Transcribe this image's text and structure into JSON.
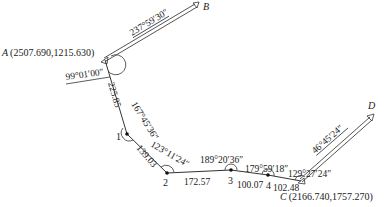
{
  "diagram": {
    "type": "traverse-survey",
    "points": {
      "A": {
        "label": "A",
        "coords": "(2507.690,1215.630)"
      },
      "B": {
        "label": "B"
      },
      "C": {
        "label": "C",
        "coords": "(2166.740,1757.270)"
      },
      "D": {
        "label": "D"
      },
      "p1": {
        "label": "1"
      },
      "p2": {
        "label": "2"
      },
      "p3": {
        "label": "3"
      },
      "p4": {
        "label": "4"
      }
    },
    "azimuths": {
      "AB": "237°59′30″",
      "CD": "46°45′24″"
    },
    "angles": {
      "A": "99°01′00″",
      "p1": "167°45′36″",
      "p2": "123°11′24″",
      "p3": "189°20′36″",
      "p4": "179°59′18″",
      "C": "129°27′24″"
    },
    "distances": {
      "A_1": "225.85",
      "p1_p2": "139.03",
      "p2_p3": "172.57",
      "p3_p4": "100.07",
      "p4_C": "102.48"
    }
  }
}
